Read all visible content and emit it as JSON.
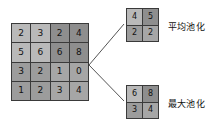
{
  "diagram": {
    "input": {
      "name": "input-feature-map",
      "rows": 4,
      "cols": 4,
      "values": [
        [
          2,
          3,
          2,
          4
        ],
        [
          5,
          6,
          6,
          8
        ],
        [
          3,
          2,
          1,
          0
        ],
        [
          1,
          2,
          3,
          4
        ]
      ],
      "quadrant_shades": [
        [
          "shade-a",
          "shade-a",
          "shade-b",
          "shade-b"
        ],
        [
          "shade-a",
          "shade-a",
          "shade-b",
          "shade-b"
        ],
        [
          "shade-c",
          "shade-c",
          "shade-d",
          "shade-d"
        ],
        [
          "shade-c",
          "shade-c",
          "shade-d",
          "shade-d"
        ]
      ]
    },
    "outputs": [
      {
        "name": "average-pooling-output",
        "label": "平均池化",
        "rows": 2,
        "cols": 2,
        "values": [
          [
            4,
            5
          ],
          [
            2,
            2
          ]
        ],
        "shades": [
          [
            "shade-a",
            "shade-b"
          ],
          [
            "shade-c",
            "shade-d"
          ]
        ]
      },
      {
        "name": "max-pooling-output",
        "label": "最大池化",
        "rows": 2,
        "cols": 2,
        "values": [
          [
            6,
            8
          ],
          [
            3,
            4
          ]
        ],
        "shades": [
          [
            "shade-a",
            "shade-b"
          ],
          [
            "shade-c",
            "shade-d"
          ]
        ]
      }
    ],
    "connectors": {
      "vertex_x": 89,
      "vertex_y": 65,
      "upper_end_x": 124,
      "upper_end_y": 24,
      "lower_end_x": 124,
      "lower_end_y": 101,
      "color": "#555555"
    },
    "cells": {
      "r0c0": 2,
      "r0c1": 3,
      "r0c2": 2,
      "r0c3": 4,
      "r1c0": 5,
      "r1c1": 6,
      "r1c2": 6,
      "r1c3": 8,
      "r2c0": 3,
      "r2c1": 2,
      "r2c2": 1,
      "r2c3": 0,
      "r3c0": 1,
      "r3c1": 2,
      "r3c2": 3,
      "r3c3": 4,
      "avg_r0c0": 4,
      "avg_r0c1": 5,
      "avg_r1c0": 2,
      "avg_r1c1": 2,
      "max_r0c0": 6,
      "max_r0c1": 8,
      "max_r1c0": 3,
      "max_r1c1": 4
    }
  }
}
